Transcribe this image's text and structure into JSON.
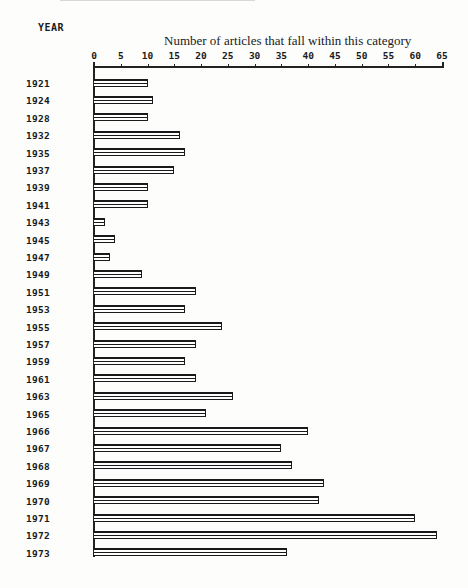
{
  "chart_data": {
    "type": "bar",
    "orientation": "horizontal",
    "title": "Number of articles that fall within this category",
    "xlabel": "Number of articles that fall within this category",
    "ylabel": "YEAR",
    "xlim": [
      0,
      65
    ],
    "x_ticks": [
      0,
      5,
      10,
      15,
      20,
      25,
      30,
      35,
      40,
      45,
      50,
      55,
      60,
      65
    ],
    "x_tick_labels": [
      "0",
      "5",
      "10",
      "15",
      "20",
      "25",
      "30",
      "35",
      "40",
      "45",
      "50",
      "55",
      "60",
      "65"
    ],
    "axis_position": "top",
    "grid": false,
    "legend": null,
    "categories": [
      "1921",
      "1924",
      "1928",
      "1932",
      "1935",
      "1937",
      "1939",
      "1941",
      "1943",
      "1945",
      "1947",
      "1949",
      "1951",
      "1953",
      "1955",
      "1957",
      "1959",
      "1961",
      "1963",
      "1965",
      "1966",
      "1967",
      "1968",
      "1969",
      "1970",
      "1971",
      "1972",
      "1973"
    ],
    "values": [
      10,
      11,
      10,
      16,
      17,
      15,
      10,
      10,
      2,
      4,
      3,
      9,
      19,
      17,
      24,
      19,
      17,
      19,
      26,
      21,
      40,
      35,
      37,
      43,
      42,
      60,
      64,
      36
    ]
  },
  "labels": {
    "ylabel": "YEAR",
    "title": "Number of articles that fall within this category"
  },
  "colors": {
    "bar_outline": "#1a1a1a",
    "bar_fill": "#ffffff",
    "background": "#fdfdfc"
  }
}
